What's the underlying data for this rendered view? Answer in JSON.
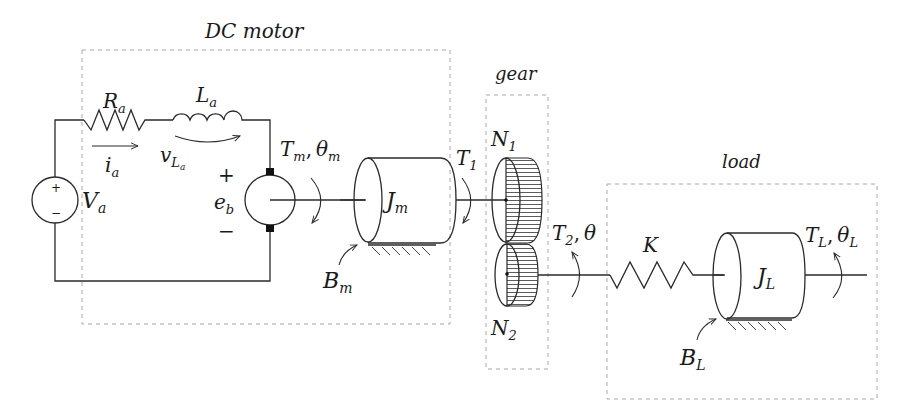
{
  "diagram": {
    "type": "electromechanical schematic",
    "groups": {
      "dc_motor": {
        "title": "DC motor"
      },
      "gear": {
        "title": "gear"
      },
      "load": {
        "title": "load"
      }
    },
    "circuit": {
      "source": {
        "label": "V",
        "sub": "a",
        "plus": "+",
        "minus": "−"
      },
      "resistor": {
        "label": "R",
        "sub": "a"
      },
      "inductor": {
        "label": "L",
        "sub": "a"
      },
      "current": {
        "label": "i",
        "sub": "a"
      },
      "inductor_voltage": {
        "label": "v",
        "sub": "L",
        "subsub": "a"
      },
      "back_emf": {
        "label": "e",
        "sub": "b",
        "plus": "+",
        "minus": "−"
      }
    },
    "motor_shaft": {
      "torque": {
        "label": "T",
        "sub": "m"
      },
      "sep": ",",
      "angle": {
        "label": "θ",
        "sub": "m"
      }
    },
    "motor_inertia": {
      "label": "J",
      "sub": "m"
    },
    "motor_friction": {
      "label": "B",
      "sub": "m"
    },
    "gear_in_torque": {
      "label": "T",
      "sub": "1"
    },
    "gear1": {
      "label": "N",
      "sub": "1"
    },
    "gear2": {
      "label": "N",
      "sub": "2"
    },
    "gear_out": {
      "torque": {
        "label": "T",
        "sub": "2"
      },
      "sep": ",",
      "angle": {
        "label": "θ"
      }
    },
    "spring": {
      "label": "K"
    },
    "load_inertia": {
      "label": "J",
      "sub": "L"
    },
    "load_friction": {
      "label": "B",
      "sub": "L"
    },
    "load_shaft": {
      "torque": {
        "label": "T",
        "sub": "L"
      },
      "sep": ",",
      "angle": {
        "label": "θ",
        "sub": "L"
      }
    }
  }
}
